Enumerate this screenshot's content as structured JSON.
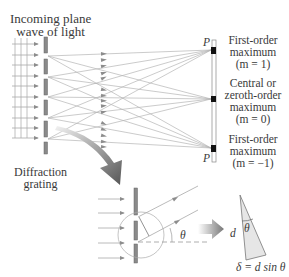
{
  "labels": {
    "incoming": [
      "Incoming plane",
      "wave of light"
    ],
    "grating": [
      "Diffraction",
      "grating"
    ],
    "first_order_top": [
      "First-order",
      "maximum",
      "(m = 1)"
    ],
    "central": [
      "Central or",
      "zeroth-order",
      "maximum",
      "(m = 0)"
    ],
    "first_order_bottom": [
      "First-order",
      "maximum",
      "(m = −1)"
    ],
    "point_p": "P",
    "theta": "θ",
    "d": "d",
    "formula": "δ = d sin θ"
  },
  "colors": {
    "ray": "#a8a8a8",
    "slit": "#8a8a8a",
    "screen_mark": "#111111",
    "arrow_dark": "#555555",
    "triangle_fill": "#e6e6e6"
  }
}
